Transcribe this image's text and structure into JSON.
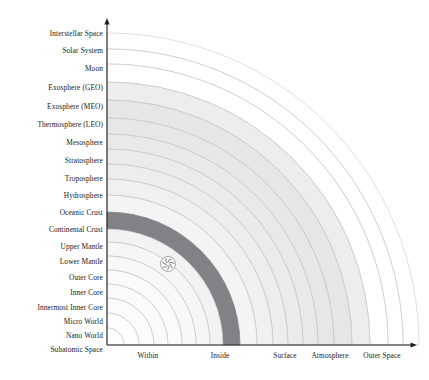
{
  "figure": {
    "title": "",
    "background": "#ffffff",
    "axis_color": "#231f20",
    "text_color": "#1a1a1a"
  },
  "origin": {
    "x": 107,
    "y": 345
  },
  "axes": {
    "y_axis_top": 18,
    "x_axis_right": 417,
    "y_label_right_edge": 103,
    "x_label_baseline_y": 351
  },
  "chart_data": {
    "type": "area",
    "subtype": "concentric-quarter-arcs",
    "title": "",
    "xlabel": "",
    "ylabel": "",
    "grid": false,
    "legend": "none",
    "x": [
      "Within",
      "Inside",
      "Surface",
      "Atmosphere",
      "Outer Space"
    ],
    "x_tick_positions": [
      148,
      220,
      285,
      330,
      382
    ],
    "categories": [
      "Subatomic Space",
      "Nano World",
      "Micro World",
      "Innermost Inner Core",
      "Inner Core",
      "Outer Core",
      "Lower Mantle",
      "Upper Mantle",
      "Continental Crust",
      "Oceanic Crust",
      "Hydrosphere",
      "Troposphere",
      "Stratosphere",
      "Mesosphere",
      "Thermosphere (LEO)",
      "Exosphere (MEO)",
      "Exosphere (GEO)",
      "Moon",
      "Solar System",
      "Interstellar Space"
    ],
    "bands": [
      {
        "label": "Subatomic Space",
        "r_inner": 0,
        "r_outer": 17,
        "fill": "#ffffff",
        "stroke": "#b9b9bc"
      },
      {
        "label": "Nano World",
        "r_inner": 17,
        "r_outer": 32,
        "fill": "#fdfdfd",
        "stroke": "#b9b9bc"
      },
      {
        "label": "Micro World",
        "r_inner": 32,
        "r_outer": 47,
        "fill": "#fbfbfb",
        "stroke": "#b9b9bc"
      },
      {
        "label": "Innermost Inner Core",
        "r_inner": 47,
        "r_outer": 61,
        "fill": "#fafafa",
        "stroke": "#b9b9bc"
      },
      {
        "label": "Inner Core",
        "r_inner": 61,
        "r_outer": 75,
        "fill": "#fafafa",
        "stroke": "#b9b9bc"
      },
      {
        "label": "Outer Core",
        "r_inner": 75,
        "r_outer": 89,
        "fill": "#f8f8f8",
        "stroke": "#b9b9bc"
      },
      {
        "label": "Lower Mantle",
        "r_inner": 89,
        "r_outer": 103,
        "fill": "#f6f6f6",
        "stroke": "#b9b9bc"
      },
      {
        "label": "Upper Mantle",
        "r_inner": 103,
        "r_outer": 116,
        "fill": "#f2f2f2",
        "stroke": "#b9b9bc"
      },
      {
        "label": "Continental Crust",
        "r_inner": 116,
        "r_outer": 133,
        "fill": "#808285",
        "stroke": "#808285"
      },
      {
        "label": "Oceanic Crust",
        "r_inner": 133,
        "r_outer": 150,
        "fill": "#f4f4f4",
        "stroke": "#b9b9bc"
      },
      {
        "label": "Hydrosphere",
        "r_inner": 150,
        "r_outer": 166,
        "fill": "#f0f0f0",
        "stroke": "#b9b9bc"
      },
      {
        "label": "Troposphere",
        "r_inner": 166,
        "r_outer": 181,
        "fill": "#ededed",
        "stroke": "#b9b9bc"
      },
      {
        "label": "Stratosphere",
        "r_inner": 181,
        "r_outer": 196,
        "fill": "#ebebeb",
        "stroke": "#b9b9bc"
      },
      {
        "label": "Mesosphere",
        "r_inner": 196,
        "r_outer": 211,
        "fill": "#e9e9e9",
        "stroke": "#b9b9bc"
      },
      {
        "label": "Thermosphere (LEO)",
        "r_inner": 211,
        "r_outer": 227,
        "fill": "#e7e7e7",
        "stroke": "#b9b9bc"
      },
      {
        "label": "Exosphere (MEO)",
        "r_inner": 227,
        "r_outer": 245,
        "fill": "#e6e6e6",
        "stroke": "#b9b9bc"
      },
      {
        "label": "Exosphere (GEO)",
        "r_inner": 245,
        "r_outer": 263,
        "fill": "#ededed",
        "stroke": "#b9b9bc"
      },
      {
        "label": "Moon",
        "r_inner": 263,
        "r_outer": 281,
        "fill": "#ffffff",
        "stroke": "#b9b9bc"
      },
      {
        "label": "Solar System",
        "r_inner": 281,
        "r_outer": 296,
        "fill": "#ffffff",
        "stroke": "#b9b9bc"
      },
      {
        "label": "Interstellar Space",
        "r_inner": 296,
        "r_outer": 312,
        "fill": "#ffffff",
        "stroke": "#c6c6c8"
      }
    ],
    "y_tick_labels": [
      {
        "label": "Interstellar Space",
        "y": 35
      },
      {
        "label": "Solar System",
        "y": 52
      },
      {
        "label": "Moon",
        "y": 70
      },
      {
        "label": "Exosphere (GEO)",
        "y": 89
      },
      {
        "label": "Exosphere (MEO)",
        "y": 108
      },
      {
        "label": "Thermosphere (LEO)",
        "y": 126
      },
      {
        "label": "Mesosphere",
        "y": 144
      },
      {
        "label": "Stratosphere",
        "y": 162
      },
      {
        "label": "Troposphere",
        "y": 180
      },
      {
        "label": "Hydrosphere",
        "y": 197
      },
      {
        "label": "Oceanic Crust",
        "y": 214
      },
      {
        "label": "Continental Crust",
        "y": 231
      },
      {
        "label": "Upper Mantle",
        "y": 248
      },
      {
        "label": "Lower Mantle",
        "y": 263
      },
      {
        "label": "Outer Core",
        "y": 279
      },
      {
        "label": "Inner Core",
        "y": 294
      },
      {
        "label": "Innermost Inner Core",
        "y": 309
      },
      {
        "label": "Micro World",
        "y": 323
      },
      {
        "label": "Nano World",
        "y": 337
      },
      {
        "label": "Subatomic Space",
        "y": 351
      }
    ]
  },
  "marker": {
    "name": "spiral-emblem",
    "cx": 168,
    "cy": 264,
    "r": 7.5,
    "color": "#ffffff",
    "stroke": "#9a9a9d"
  }
}
